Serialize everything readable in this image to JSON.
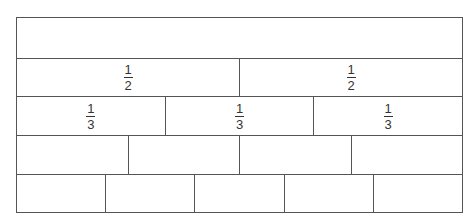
{
  "rows": [
    {
      "denominator": 1,
      "cells": [
        {
          "label_num": "",
          "label_den": ""
        }
      ]
    },
    {
      "denominator": 2,
      "cells": [
        {
          "label_num": "1",
          "label_den": "2"
        },
        {
          "label_num": "1",
          "label_den": "2"
        }
      ]
    },
    {
      "denominator": 3,
      "cells": [
        {
          "label_num": "1",
          "label_den": "3"
        },
        {
          "label_num": "1",
          "label_den": "3"
        },
        {
          "label_num": "1",
          "label_den": "3"
        }
      ]
    },
    {
      "denominator": 4,
      "cells": [
        {},
        {},
        {},
        {}
      ]
    },
    {
      "denominator": 5,
      "cells": [
        {},
        {},
        {},
        {},
        {}
      ]
    }
  ],
  "colors": {
    "line": "#555555",
    "text": "#333333",
    "background": "#ffffff"
  }
}
